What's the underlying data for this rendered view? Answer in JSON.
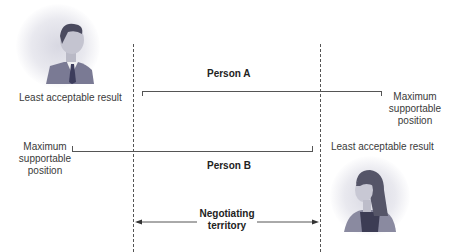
{
  "person_a": {
    "label": "Person A",
    "left_label": "Least acceptable result",
    "right_label_lines": [
      "Maximum",
      "supportable",
      "position"
    ]
  },
  "person_b": {
    "label": "Person B",
    "left_label_lines": [
      "Maximum",
      "supportable",
      "position"
    ],
    "right_label": "Least acceptable result"
  },
  "negotiating_territory": {
    "label_lines": [
      "Negotiating",
      "territory"
    ]
  },
  "colors": {
    "line": "#555555",
    "text": "#3a3a3a",
    "portrait_bg": "#d8d8e2",
    "suit": "#7a7a94"
  }
}
